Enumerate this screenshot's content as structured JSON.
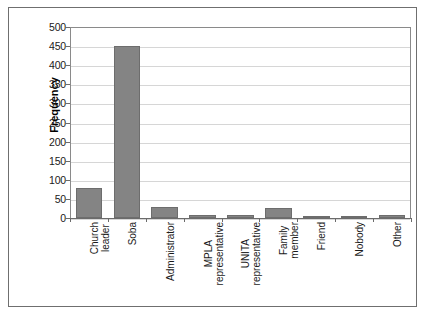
{
  "figure": {
    "caption_strip": "",
    "background": "#ffffff",
    "border_color": "#6f6f6f"
  },
  "chart_data": {
    "type": "bar",
    "title": "",
    "subtitle": "",
    "xlabel": "",
    "ylabel": "Frequency",
    "ylim": [
      0,
      500
    ],
    "ytick_step": 50,
    "yticks": [
      "0",
      "50",
      "100",
      "150",
      "200",
      "250",
      "300",
      "350",
      "400",
      "450",
      "500"
    ],
    "grid": true,
    "grid_axis": "y",
    "legend": false,
    "legend_position": "none",
    "bar_color": "#848484",
    "bar_edge_color": "#6d6d6d",
    "categories": [
      "Church leader",
      "Soba",
      "Administrator",
      "MPLA representative",
      "UNITA representative",
      "Family member",
      "Friend",
      "Nobody",
      "Other"
    ],
    "category_lines": [
      [
        "Church",
        "leader"
      ],
      [
        "Soba",
        ""
      ],
      [
        "Administrator",
        ""
      ],
      [
        "MPLA",
        "representative"
      ],
      [
        "UNITA",
        "representative"
      ],
      [
        "Family",
        "member"
      ],
      [
        "Friend",
        ""
      ],
      [
        "Nobody",
        ""
      ],
      [
        "Other",
        ""
      ]
    ],
    "values": [
      78,
      450,
      30,
      9,
      7,
      27,
      2,
      1,
      8
    ]
  }
}
